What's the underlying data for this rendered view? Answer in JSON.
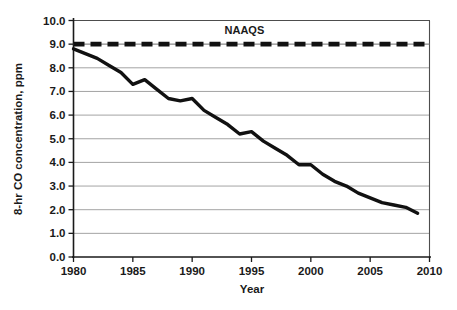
{
  "chart_data": {
    "type": "line",
    "title": "",
    "xlabel": "Year",
    "ylabel": "8-hr CO concentration, ppm",
    "xlim": [
      1980,
      2010
    ],
    "ylim": [
      0.0,
      10.0
    ],
    "grid": true,
    "legend_position": "inline-annotation",
    "x_ticks": [
      1980,
      1985,
      1990,
      1995,
      2000,
      2005,
      2010
    ],
    "x_tick_labels": [
      "1980",
      "1985",
      "1990",
      "1995",
      "2000",
      "2005",
      "2010"
    ],
    "y_ticks": [
      0.0,
      1.0,
      2.0,
      3.0,
      4.0,
      5.0,
      6.0,
      7.0,
      8.0,
      9.0,
      10.0
    ],
    "y_tick_labels": [
      "0.0",
      "1.0",
      "2.0",
      "3.0",
      "4.0",
      "5.0",
      "6.0",
      "7.0",
      "8.0",
      "9.0",
      "10.0"
    ],
    "series": [
      {
        "name": "8-hr CO concentration",
        "style": "solid",
        "color": "#111111",
        "x": [
          1980,
          1981,
          1982,
          1983,
          1984,
          1985,
          1986,
          1987,
          1988,
          1989,
          1990,
          1991,
          1992,
          1993,
          1994,
          1995,
          1996,
          1997,
          1998,
          1999,
          2000,
          2001,
          2002,
          2003,
          2004,
          2005,
          2006,
          2007,
          2008,
          2009
        ],
        "values": [
          8.8,
          8.6,
          8.4,
          8.1,
          7.8,
          7.3,
          7.5,
          7.1,
          6.7,
          6.6,
          6.7,
          6.2,
          5.9,
          5.6,
          5.2,
          5.3,
          4.9,
          4.6,
          4.3,
          3.9,
          3.9,
          3.5,
          3.2,
          3.0,
          2.7,
          2.5,
          2.3,
          2.2,
          2.1,
          1.85
        ]
      },
      {
        "name": "NAAQS",
        "style": "dashed",
        "color": "#111111",
        "x": [
          1980,
          2010
        ],
        "values": [
          9.0,
          9.0
        ]
      }
    ],
    "annotations": [
      {
        "text": "NAAQS",
        "x": 1994.4,
        "y": 9.45
      }
    ]
  },
  "axes": {
    "y_title": "8-hr CO concentration, ppm",
    "x_title": "Year"
  },
  "caption": {
    "partial_text": ""
  }
}
